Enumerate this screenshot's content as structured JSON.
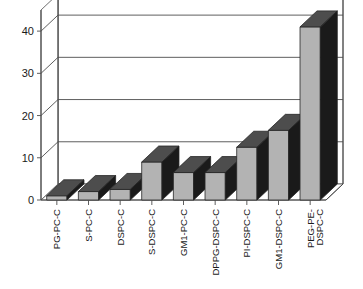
{
  "chart_data": {
    "type": "bar",
    "title": "",
    "subtitle": "",
    "xlabel": "",
    "ylabel": "",
    "ylim": [
      0,
      45
    ],
    "yticks": [
      0,
      10,
      20,
      30,
      40
    ],
    "ytick_labels": [
      "0",
      "10",
      "20",
      "30",
      "40"
    ],
    "grid": true,
    "legend": false,
    "legend_position": "none",
    "three_d": true,
    "categories": [
      "PG-PC-C",
      "S-PC-C",
      "DSPC-C",
      "S-DSPC-C",
      "GM1-PC-C",
      "DPPG-DSPC-C",
      "PI-DSPC-C",
      "GM1-DSPC-C",
      "PEG-PE-DSPC-C"
    ],
    "category_lines": [
      [
        "PG-PC-C"
      ],
      [
        "S-PC-C"
      ],
      [
        "DSPC-C"
      ],
      [
        "S-DSPC-C"
      ],
      [
        "GM1-PC-C"
      ],
      [
        "DPPG-DSPC-C"
      ],
      [
        "PI-DSPC-C"
      ],
      [
        "GM1-DSPC-C"
      ],
      [
        "PEG-PE-",
        "DSPC-C"
      ]
    ],
    "values": [
      1,
      2,
      2.5,
      9,
      6.5,
      6.5,
      12.5,
      16.5,
      41
    ],
    "series": [
      {
        "name": "value",
        "values": [
          1,
          2,
          2.5,
          9,
          6.5,
          6.5,
          12.5,
          16.5,
          41
        ]
      }
    ]
  },
  "colors": {
    "bar_front": "#b3b3b3",
    "bar_top": "#4d4d4d",
    "bar_side": "#1a1a1a",
    "floor": "#ffffff",
    "wall": "#ffffff",
    "grid": "#4d4d4d",
    "axis": "#4d4d4d",
    "text": "#1a1a1a",
    "background": "#ffffff"
  }
}
